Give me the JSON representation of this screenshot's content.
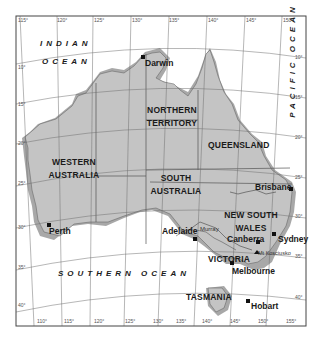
{
  "map": {
    "colors": {
      "land": "#c4c4c4",
      "shelf": "#a8a8a8",
      "water": "#ffffff",
      "grid": "#6e6e6e",
      "border": "#555555",
      "frame": "#444444"
    },
    "oceans": {
      "indian_line1": "INDIAN",
      "indian_line2": "OCEAN",
      "pacific": "PACIFIC OCEAN",
      "southern": "SOUTHERN OCEAN"
    },
    "states": {
      "nt_line1": "NORTHERN",
      "nt_line2": "TERRITORY",
      "qld": "QUEENSLAND",
      "wa_line1": "WESTERN",
      "wa_line2": "AUSTRALIA",
      "sa_line1": "SOUTH",
      "sa_line2": "AUSTRALIA",
      "nsw_line1": "NEW SOUTH",
      "nsw_line2": "WALES",
      "vic": "VICTORIA",
      "tas": "TASMANIA"
    },
    "cities": {
      "darwin": "Darwin",
      "brisbane": "Brisbane",
      "perth": "Perth",
      "adelaide": "Adelaide",
      "canberra": "Canberra",
      "sydney": "Sydney",
      "melbourne": "Melbourne",
      "hobart": "Hobart"
    },
    "features": {
      "murray": "Murray",
      "kosciusko": "Mt Kosciusko"
    },
    "ticks": {
      "top": [
        "115°",
        "120°",
        "125°",
        "130°",
        "135°",
        "140°",
        "145°",
        "150°"
      ],
      "bottom": [
        "110°",
        "115°",
        "120°",
        "125°",
        "130°",
        "135°",
        "140°",
        "145°",
        "150°",
        "155°"
      ],
      "left": [
        "10°",
        "15°",
        "20°",
        "25°",
        "30°",
        "35°",
        "40°"
      ],
      "right": [
        "10°",
        "15°",
        "20°",
        "25°",
        "30°",
        "35°",
        "40°"
      ]
    }
  }
}
